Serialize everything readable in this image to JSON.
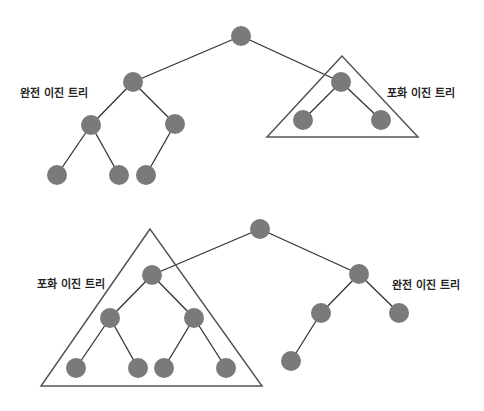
{
  "style": {
    "node_color": "#7a7a7a",
    "edge_color": "#333333",
    "triangle_color": "#555555",
    "node_radius": 10
  },
  "labels": [
    {
      "id": "top-complete",
      "text": "완전 이진 트리",
      "x": 20,
      "y": 84
    },
    {
      "id": "top-full",
      "text": "포화 이진 트리",
      "x": 387,
      "y": 84
    },
    {
      "id": "bottom-full",
      "text": "포화 이진 트리",
      "x": 37,
      "y": 275
    },
    {
      "id": "bottom-complete",
      "text": "완전 이진 트리",
      "x": 392,
      "y": 276
    }
  ],
  "diagrams": [
    {
      "name": "top-tree",
      "nodes": [
        {
          "id": "r",
          "x": 241,
          "y": 36
        },
        {
          "id": "L",
          "x": 133,
          "y": 82
        },
        {
          "id": "R",
          "x": 341,
          "y": 82
        },
        {
          "id": "LL",
          "x": 91,
          "y": 125
        },
        {
          "id": "LR",
          "x": 175,
          "y": 124
        },
        {
          "id": "LLL",
          "x": 57,
          "y": 175
        },
        {
          "id": "LLR",
          "x": 119,
          "y": 175
        },
        {
          "id": "LRL",
          "x": 146,
          "y": 175
        },
        {
          "id": "RL",
          "x": 303,
          "y": 120
        },
        {
          "id": "RR",
          "x": 381,
          "y": 120
        }
      ],
      "edges": [
        [
          "r",
          "L"
        ],
        [
          "r",
          "R"
        ],
        [
          "L",
          "LL"
        ],
        [
          "L",
          "LR"
        ],
        [
          "LL",
          "LLL"
        ],
        [
          "LL",
          "LLR"
        ],
        [
          "LR",
          "LRL"
        ],
        [
          "R",
          "RL"
        ],
        [
          "R",
          "RR"
        ]
      ],
      "triangle": [
        [
          342,
          56
        ],
        [
          267,
          137
        ],
        [
          418,
          137
        ]
      ]
    },
    {
      "name": "bottom-tree",
      "nodes": [
        {
          "id": "r",
          "x": 260,
          "y": 229
        },
        {
          "id": "L",
          "x": 152,
          "y": 275
        },
        {
          "id": "R",
          "x": 359,
          "y": 274
        },
        {
          "id": "LL",
          "x": 110,
          "y": 318
        },
        {
          "id": "LR",
          "x": 194,
          "y": 318
        },
        {
          "id": "LLL",
          "x": 76,
          "y": 368
        },
        {
          "id": "LLR",
          "x": 138,
          "y": 368
        },
        {
          "id": "LRL",
          "x": 164,
          "y": 368
        },
        {
          "id": "LRR",
          "x": 226,
          "y": 368
        },
        {
          "id": "RL",
          "x": 321,
          "y": 313
        },
        {
          "id": "RR",
          "x": 399,
          "y": 313
        },
        {
          "id": "RLL",
          "x": 291,
          "y": 361
        }
      ],
      "edges": [
        [
          "r",
          "L"
        ],
        [
          "r",
          "R"
        ],
        [
          "L",
          "LL"
        ],
        [
          "L",
          "LR"
        ],
        [
          "LL",
          "LLL"
        ],
        [
          "LL",
          "LLR"
        ],
        [
          "LR",
          "LRL"
        ],
        [
          "LR",
          "LRR"
        ],
        [
          "R",
          "RL"
        ],
        [
          "R",
          "RR"
        ],
        [
          "RL",
          "RLL"
        ]
      ],
      "triangle": [
        [
          150,
          229
        ],
        [
          41,
          386
        ],
        [
          262,
          386
        ]
      ]
    }
  ]
}
